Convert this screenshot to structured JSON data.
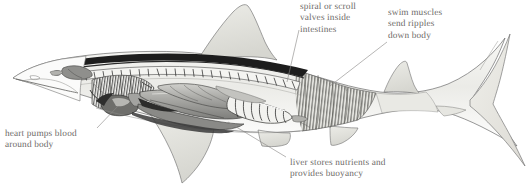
{
  "figure": {
    "style": "pencil and wash scientific illustration, cutaway view, left-facing head, heterocercal tail",
    "background_color": "#ffffff",
    "label_text_color": "#6d6a68",
    "leader_line_color": "#8a8886",
    "outline_color": "#6b6b6b",
    "body_fill_color": "#efefec",
    "fin_fill_color": "#e2e2dd",
    "organ_dark_color": "#4a4a4a",
    "organ_mid_color": "#9a9a97",
    "organ_light_color": "#d2d2ce",
    "spine_color": "#1d1d1d"
  },
  "labels": [
    {
      "id": "intestines",
      "lines": [
        "spiral or scroll",
        "valves inside",
        "intestines"
      ],
      "text": "spiral or scroll\nvalves inside\nintestines",
      "anchor": "top-center",
      "leader": {
        "x1": 299,
        "y1": 30,
        "x2": 287,
        "y2": 82
      }
    },
    {
      "id": "muscles",
      "lines": [
        "swim muscles",
        "send ripples",
        "down body"
      ],
      "text": "swim muscles\nsend ripples\ndown body",
      "anchor": "top-right",
      "leader": {
        "x1": 387,
        "y1": 42,
        "x2": 330,
        "y2": 86
      }
    },
    {
      "id": "heart",
      "lines": [
        "heart pumps blood",
        "around body"
      ],
      "text": "heart pumps blood\naround body",
      "anchor": "bottom-left",
      "leader": {
        "x1": 97,
        "y1": 128,
        "x2": 118,
        "y2": 106
      }
    },
    {
      "id": "liver",
      "lines": [
        "liver stores nutrients and",
        "provides buoyancy"
      ],
      "text": "liver stores nutrients and\nprovides buoyancy",
      "anchor": "bottom-center",
      "leader": {
        "x1": 286,
        "y1": 157,
        "x2": 228,
        "y2": 122
      }
    }
  ],
  "anatomy_parts": [
    "snout",
    "brain",
    "gill arches",
    "heart",
    "liver",
    "stomach",
    "spiral valve intestine",
    "vertebral column",
    "swim muscle blocks",
    "dorsal fin",
    "second dorsal fin",
    "pectoral fin",
    "pelvic fin",
    "anal fin",
    "heterocercal caudal fin"
  ]
}
